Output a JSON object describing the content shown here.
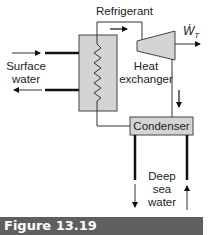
{
  "diagram": {
    "labels": {
      "refrigerant": "Refrigerant",
      "surface_water_line1": "Surface",
      "surface_water_line2": "water",
      "heat_exchanger_line1": "Heat",
      "heat_exchanger_line2": "exchanger",
      "condenser": "Condenser",
      "deep_sea_line1": "Deep",
      "deep_sea_line2": "sea",
      "deep_sea_line3": "water",
      "work_symbol": "Ẇ",
      "work_subscript": "T"
    },
    "components": [
      "heat-exchanger",
      "turbine",
      "condenser"
    ],
    "colors": {
      "component_fill": "#d4d4d4",
      "line": "#333333",
      "thick_pipe": "#111111",
      "caption_bar": "#5f5f5f",
      "caption_text": "#ffffff"
    }
  },
  "caption": {
    "text": "Figure 13.19"
  }
}
